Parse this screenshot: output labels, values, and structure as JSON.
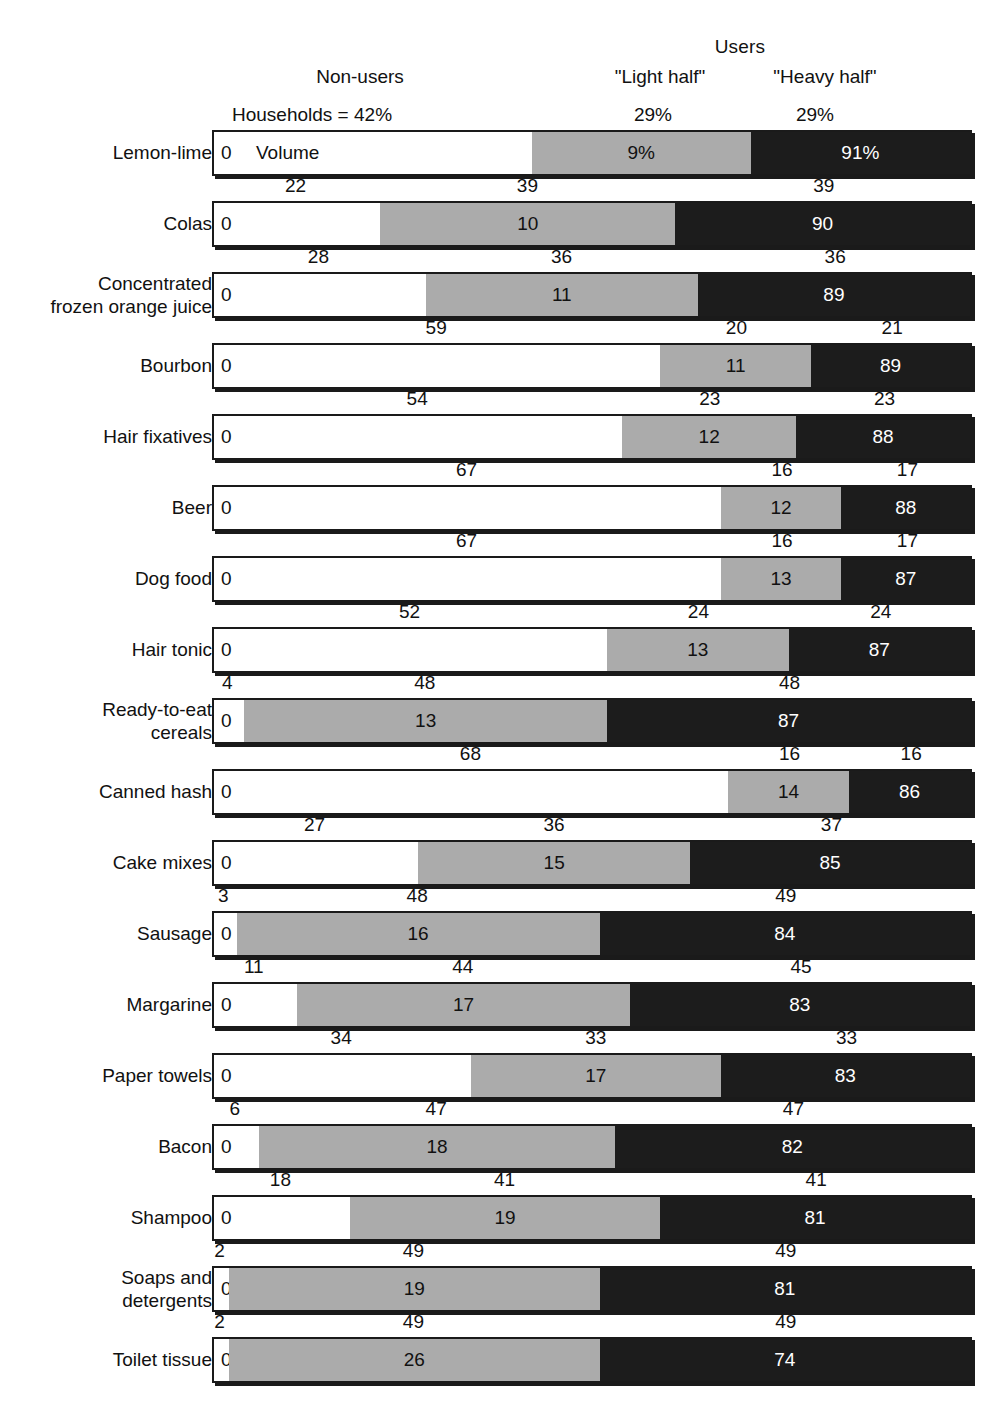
{
  "header": {
    "users": "Users",
    "non_users": "Non-users",
    "light_half": "\"Light half\"",
    "heavy_half": "\"Heavy half\"",
    "households_label": "Households = 42%",
    "light_pct": "29%",
    "heavy_pct": "29%"
  },
  "chart_data": {
    "type": "bar",
    "subtype": "stacked-horizontal-100pct",
    "title": "",
    "xlabel": "",
    "ylabel": "",
    "xlim": [
      0,
      100
    ],
    "grid": false,
    "legend_position": "top",
    "categories": [
      "Lemon-lime",
      "Colas",
      "Concentrated\nfrozen orange juice",
      "Bourbon",
      "Hair fixatives",
      "Beer",
      "Dog food",
      "Hair tonic",
      "Ready-to-eat\ncereals",
      "Canned hash",
      "Cake mixes",
      "Sausage",
      "Margarine",
      "Paper towels",
      "Bacon",
      "Shampoo",
      "Soaps and\ndetergents",
      "Toilet tissue"
    ],
    "series": [
      {
        "name": "Non-users",
        "key": "nonuser",
        "color": "#ffffff",
        "values": [
          42,
          22,
          28,
          59,
          54,
          67,
          67,
          52,
          4,
          68,
          27,
          3,
          11,
          34,
          6,
          18,
          2,
          2
        ]
      },
      {
        "name": "\"Light half\"",
        "key": "light",
        "color": "#ababab",
        "values": [
          29,
          39,
          36,
          20,
          23,
          16,
          16,
          24,
          48,
          16,
          36,
          48,
          44,
          33,
          47,
          41,
          49,
          49
        ]
      },
      {
        "name": "\"Heavy half\"",
        "key": "heavy",
        "color": "#1c1c1c",
        "values": [
          29,
          39,
          36,
          21,
          23,
          17,
          17,
          24,
          48,
          16,
          37,
          49,
          45,
          33,
          47,
          41,
          49,
          49
        ]
      }
    ],
    "volume_labels": [
      {
        "nonuser": "0",
        "light": "9%",
        "heavy": "91%"
      },
      {
        "nonuser": "0",
        "light": "10",
        "heavy": "90"
      },
      {
        "nonuser": "0",
        "light": "11",
        "heavy": "89"
      },
      {
        "nonuser": "0",
        "light": "11",
        "heavy": "89"
      },
      {
        "nonuser": "0",
        "light": "12",
        "heavy": "88"
      },
      {
        "nonuser": "0",
        "light": "12",
        "heavy": "88"
      },
      {
        "nonuser": "0",
        "light": "13",
        "heavy": "87"
      },
      {
        "nonuser": "0",
        "light": "13",
        "heavy": "87"
      },
      {
        "nonuser": "0",
        "light": "13",
        "heavy": "87"
      },
      {
        "nonuser": "0",
        "light": "14",
        "heavy": "86"
      },
      {
        "nonuser": "0",
        "light": "15",
        "heavy": "85"
      },
      {
        "nonuser": "0",
        "light": "16",
        "heavy": "84"
      },
      {
        "nonuser": "0",
        "light": "17",
        "heavy": "83"
      },
      {
        "nonuser": "0",
        "light": "17",
        "heavy": "83"
      },
      {
        "nonuser": "0",
        "light": "18",
        "heavy": "82"
      },
      {
        "nonuser": "0",
        "light": "19",
        "heavy": "81"
      },
      {
        "nonuser": "0",
        "light": "19",
        "heavy": "81"
      },
      {
        "nonuser": "0",
        "light": "26",
        "heavy": "74"
      }
    ],
    "household_tick_labels": [
      {
        "nonuser": "42",
        "light": "29",
        "heavy": "29"
      },
      {
        "nonuser": "22",
        "light": "39",
        "heavy": "39"
      },
      {
        "nonuser": "28",
        "light": "36",
        "heavy": "36"
      },
      {
        "nonuser": "59",
        "light": "20",
        "heavy": "21"
      },
      {
        "nonuser": "54",
        "light": "23",
        "heavy": "23"
      },
      {
        "nonuser": "67",
        "light": "16",
        "heavy": "17"
      },
      {
        "nonuser": "67",
        "light": "16",
        "heavy": "17"
      },
      {
        "nonuser": "52",
        "light": "24",
        "heavy": "24"
      },
      {
        "nonuser": "4",
        "light": "48",
        "heavy": "48"
      },
      {
        "nonuser": "68",
        "light": "16",
        "heavy": "16"
      },
      {
        "nonuser": "27",
        "light": "36",
        "heavy": "37"
      },
      {
        "nonuser": "3",
        "light": "48",
        "heavy": "49"
      },
      {
        "nonuser": "11",
        "light": "44",
        "heavy": "45"
      },
      {
        "nonuser": "34",
        "light": "33",
        "heavy": "33"
      },
      {
        "nonuser": "6",
        "light": "47",
        "heavy": "47"
      },
      {
        "nonuser": "18",
        "light": "41",
        "heavy": "41"
      },
      {
        "nonuser": "2",
        "light": "49",
        "heavy": "49"
      },
      {
        "nonuser": "2",
        "light": "49",
        "heavy": "49"
      }
    ],
    "volume_annotation": "Volume",
    "annotations": [
      "Households = 42%",
      "Volume"
    ]
  },
  "layout": {
    "bar_left_px": 212,
    "bar_width_px": 760,
    "first_row_top_px": 130,
    "row_pitch_px": 71,
    "bar_height_px": 46
  },
  "colors": {
    "nonuser": "#ffffff",
    "light_half": "#ababab",
    "heavy_half": "#1c1c1c",
    "outline": "#1a1a1a",
    "background": "#ffffff"
  }
}
